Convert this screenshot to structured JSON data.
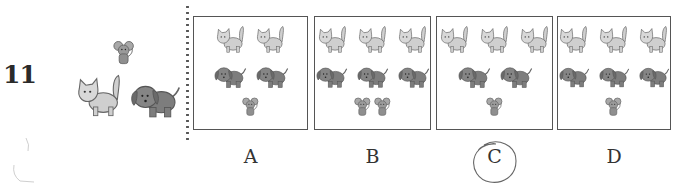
{
  "question": {
    "number": "11",
    "reference": {
      "mice": 1,
      "cats": 1,
      "dogs": 1
    }
  },
  "options": [
    {
      "label": "A",
      "cats": 2,
      "dogs": 2,
      "mice": 1,
      "selected": false
    },
    {
      "label": "B",
      "cats": 3,
      "dogs": 3,
      "mice": 2,
      "selected": false
    },
    {
      "label": "C",
      "cats": 3,
      "dogs": 2,
      "mice": 1,
      "selected": true
    },
    {
      "label": "D",
      "cats": 3,
      "dogs": 3,
      "mice": 1,
      "selected": false
    }
  ],
  "icons": {
    "cat": "cat-icon",
    "dog": "dog-icon",
    "mouse": "mouse-icon"
  },
  "colors": {
    "cat_fill": "#cfcfcf",
    "dog_fill": "#7d7d7d",
    "mouse_fill": "#9a9a9a",
    "outline": "#555555",
    "box_border": "#555555"
  },
  "selected_answer": "C"
}
